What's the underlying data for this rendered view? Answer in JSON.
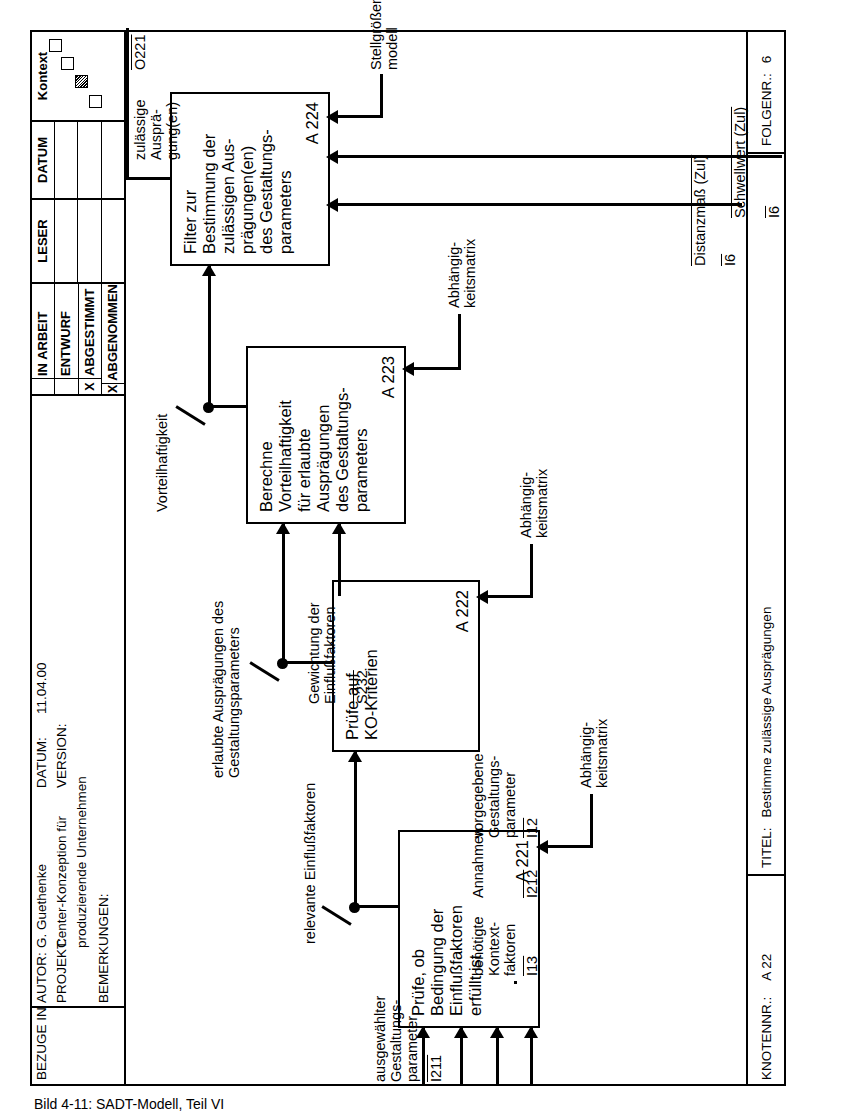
{
  "header": {
    "bezuge_label": "BEZUGE IN",
    "autor_label": "AUTOR:",
    "autor_value": "G. Guethenke",
    "projekt_label": "PROJEKT:",
    "projekt_value_line1": "Center-Konzeption für",
    "projekt_value_line2": "produzierende Unternehmen",
    "datum_label": "DATUM:",
    "datum_value": "11.04.00",
    "version_label": "VERSION:",
    "bemerkungen_label": "BEMERKUNGEN:",
    "status_rows": [
      {
        "mark": "",
        "label": "IN ARBEIT"
      },
      {
        "mark": "",
        "label": "ENTWURF"
      },
      {
        "mark": "X",
        "label": "ABGESTIMMT"
      },
      {
        "mark": "X",
        "label": "ABGENOMMEN"
      }
    ],
    "leser_label": "LESER",
    "datum2_label": "DATUM",
    "kontext_label": "Kontext"
  },
  "footer": {
    "knotennr_label": "KNOTENNR.:",
    "knotennr_value": "A 22",
    "titel_label": "TITEL:",
    "titel_value": "Bestimme zulässige Ausprägungen",
    "folgenr_label": "FOLGENR.:",
    "folgenr_value": "6"
  },
  "boxes": [
    {
      "id": "A 221",
      "text": "Prüfe, ob\nBedingung der\nEinflußfaktoren\nerfüllt ist"
    },
    {
      "id": "A 222",
      "text": "Prüfe auf\nKO-Kriterien"
    },
    {
      "id": "A 223",
      "text": "Berechne\nVorteilhaftigkeit\nfür erlaubte\nAusprägungen\ndes Gestaltungs-\nparameters"
    },
    {
      "id": "A 224",
      "text": "Filter zur\nBestimmung der\nzulässigen Aus-\nprägungen(en)\ndes Gestaltungs-\nparameters"
    }
  ],
  "arrows": {
    "in_ausgewaehlter": "ausgewählter\nGestaltungs-\nparameter",
    "in_ausgewaehlter_code": "I211",
    "in_kontextfaktoren": "benötigte\nKontext-\nfaktoren",
    "in_kontextfaktoren_code": "I13",
    "in_annahmen": "Annahmen",
    "in_annahmen_code": "I212",
    "in_vorgegebene": "vorgegebene\nGestaltungs-\nparameter",
    "in_vorgegebene_code": "I12",
    "in_distanzmass": "Distanzmaß (Zul)",
    "in_distanzmass_code": "I6",
    "in_schwellwert": "Schwellwert (Zul)",
    "in_schwellwert_code": "I6",
    "ctrl_abhaengig_1": "Abhängig-\nkeitsmatrix",
    "ctrl_abhaengig_2": "Abhängig-\nkeitsmatrix",
    "ctrl_abhaengig_3": "Abhängig-\nkeitsmatrix",
    "ctrl_stellgroessen": "Stellgrößen-\nmodell",
    "mid_relevante": "relevante Einflußfaktoren",
    "mid_erlaubte": "erlaubte Ausprägungen des\nGestaltungsparameters",
    "mid_gewichtung": "Gewichtung der\nEinflußfaktoren",
    "mid_gewichtung_code": "S232",
    "mid_vorteilhaftigkeit": "Vorteilhaftigkeit",
    "out_zulaessige": "zulässige\nAusprä-\ngung(en)",
    "out_zulaessige_code": "O221"
  },
  "caption": "Bild 4-11:   SADT-Modell, Teil VI"
}
